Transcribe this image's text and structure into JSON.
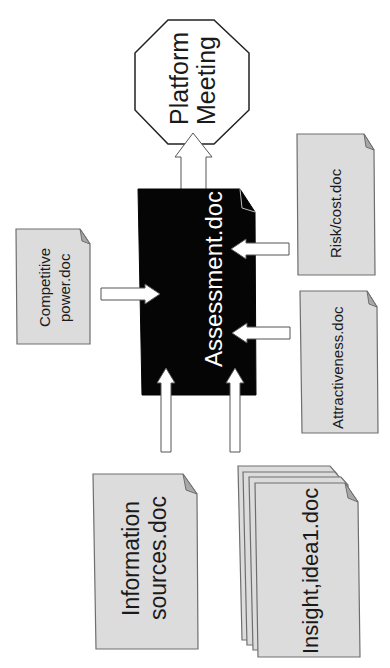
{
  "diagram": {
    "title_node": {
      "line1": "Platform",
      "line2": "Meeting"
    },
    "center_doc": {
      "label": "Assessment.doc",
      "fill": "#050505"
    },
    "docs": {
      "competitive": {
        "line1": "Competitive",
        "line2": "power.doc"
      },
      "risk": {
        "label": "Risk/cost.doc"
      },
      "attractiveness": {
        "label": "Attractiveness.doc"
      },
      "information": {
        "line1": "Information",
        "line2": "sources.doc"
      },
      "insight": {
        "label": "Insight,idea1.doc",
        "stack_count": 4
      }
    },
    "colors": {
      "doc_fill": "#dcdcdc",
      "doc_stroke": "#6e6e6e",
      "fold": "#a8a8a8",
      "center_fill": "#050505",
      "arrow_fill": "#ffffff"
    },
    "edges": [
      {
        "from": "Assessment.doc",
        "to": "Platform Meeting"
      },
      {
        "from": "Competitive power.doc",
        "to": "Assessment.doc"
      },
      {
        "from": "Risk/cost.doc",
        "to": "Assessment.doc"
      },
      {
        "from": "Attractiveness.doc",
        "to": "Assessment.doc"
      },
      {
        "from": "Information sources.doc",
        "to": "Assessment.doc"
      },
      {
        "from": "Insight,idea1.doc",
        "to": "Assessment.doc"
      }
    ]
  }
}
